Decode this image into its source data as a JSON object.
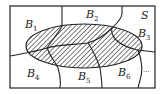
{
  "diagram": {
    "type": "set-partition",
    "sample_space_label": "S",
    "event_shaded": "ellipse (hatched)",
    "partitions": [
      {
        "name": "B",
        "sub": "1",
        "x": 25,
        "y": 28
      },
      {
        "name": "B",
        "sub": "2",
        "x": 86,
        "y": 18
      },
      {
        "name": "B",
        "sub": "3",
        "x": 138,
        "y": 37
      },
      {
        "name": "B",
        "sub": "4",
        "x": 27,
        "y": 77
      },
      {
        "name": "B",
        "sub": "5",
        "x": 78,
        "y": 80
      },
      {
        "name": "B",
        "sub": "6",
        "x": 118,
        "y": 76
      }
    ],
    "ellipsis": "...",
    "colors": {
      "line": "#222222",
      "hatch": "#333333",
      "background": "#ffffff"
    }
  }
}
